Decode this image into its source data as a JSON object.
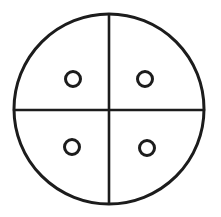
{
  "figure": {
    "background_color": "#ffffff",
    "stroke_color": "#1c1c1c",
    "canvas": {
      "width": 221,
      "height": 217
    },
    "outer_circle": {
      "cx": 109,
      "cy": 109,
      "r": 95,
      "stroke_width": 3
    },
    "divider_vertical": {
      "x1": 109,
      "y1": 15,
      "x2": 109,
      "y2": 203,
      "stroke_width": 2.6
    },
    "divider_horizontal": {
      "x1": 14,
      "y1": 110,
      "x2": 204,
      "y2": 110,
      "stroke_width": 2.6
    },
    "hole_stroke_width": 3,
    "hole_radius": 7.5,
    "holes": [
      {
        "quadrant": "top-left",
        "cx": 73,
        "cy": 79,
        "r": 7.5
      },
      {
        "quadrant": "top-right",
        "cx": 145,
        "cy": 79,
        "r": 7.5
      },
      {
        "quadrant": "bottom-left",
        "cx": 72,
        "cy": 147,
        "r": 7.5
      },
      {
        "quadrant": "bottom-right",
        "cx": 147,
        "cy": 148,
        "r": 7.5
      }
    ]
  }
}
